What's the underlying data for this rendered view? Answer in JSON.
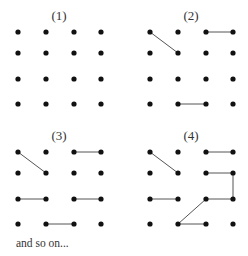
{
  "diagram": {
    "grid": {
      "rows": 4,
      "cols": 4,
      "col_offsets": [
        0,
        28,
        56,
        83
      ],
      "row_offsets": [
        0,
        21,
        47,
        72
      ]
    },
    "panels": [
      {
        "label": "(1)",
        "origin": [
          18,
          32
        ],
        "label_pos": [
          59,
          20
        ],
        "edges": []
      },
      {
        "label": "(2)",
        "origin": [
          150,
          32
        ],
        "label_pos": [
          191,
          20
        ],
        "edges": [
          [
            [
              0,
              0
            ],
            [
              1,
              1
            ]
          ],
          [
            [
              0,
              2
            ],
            [
              0,
              3
            ]
          ],
          [
            [
              3,
              1
            ],
            [
              3,
              2
            ]
          ]
        ]
      },
      {
        "label": "(3)",
        "origin": [
          18,
          152
        ],
        "label_pos": [
          59,
          140
        ],
        "edges": [
          [
            [
              0,
              0
            ],
            [
              1,
              1
            ]
          ],
          [
            [
              0,
              2
            ],
            [
              0,
              3
            ]
          ],
          [
            [
              2,
              0
            ],
            [
              2,
              1
            ]
          ],
          [
            [
              2,
              2
            ],
            [
              2,
              3
            ]
          ],
          [
            [
              3,
              1
            ],
            [
              3,
              2
            ]
          ]
        ]
      },
      {
        "label": "(4)",
        "origin": [
          150,
          152
        ],
        "label_pos": [
          191,
          140
        ],
        "edges": [
          [
            [
              0,
              0
            ],
            [
              1,
              1
            ]
          ],
          [
            [
              0,
              2
            ],
            [
              0,
              3
            ]
          ],
          [
            [
              1,
              2
            ],
            [
              1,
              3
            ]
          ],
          [
            [
              1,
              3
            ],
            [
              2,
              3
            ]
          ],
          [
            [
              2,
              0
            ],
            [
              2,
              1
            ]
          ],
          [
            [
              2,
              2
            ],
            [
              2,
              3
            ]
          ],
          [
            [
              2,
              2
            ],
            [
              3,
              1
            ]
          ],
          [
            [
              3,
              1
            ],
            [
              3,
              2
            ]
          ]
        ]
      }
    ],
    "caption": "and so on...",
    "colors": {
      "dot": "#111111",
      "edge": "#555555",
      "text": "#333333"
    }
  }
}
